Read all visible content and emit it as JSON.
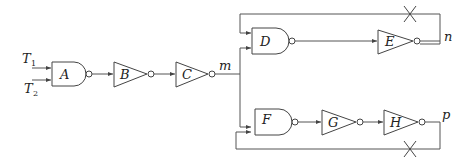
{
  "diagram": {
    "title": "",
    "inputs": [
      {
        "name": "T",
        "sub": "1"
      },
      {
        "name": "T",
        "sub": "2"
      }
    ],
    "gates": {
      "A": {
        "label": "A",
        "type": "NAND"
      },
      "B": {
        "label": "B",
        "type": "NOT"
      },
      "C": {
        "label": "C",
        "type": "NOT"
      },
      "D": {
        "label": "D",
        "type": "NAND"
      },
      "E": {
        "label": "E",
        "type": "NOT"
      },
      "F": {
        "label": "F",
        "type": "NAND"
      },
      "G": {
        "label": "G",
        "type": "NOT"
      },
      "H": {
        "label": "H",
        "type": "NOT"
      }
    },
    "nodes": {
      "m": "m",
      "n": "n",
      "p": "p"
    },
    "feedback_cuts": [
      {
        "from": "n",
        "to": "D",
        "marker": "X"
      },
      {
        "from": "p",
        "to": "F",
        "marker": "X"
      }
    ],
    "colors": {
      "stroke": "#444444",
      "background": "#ffffff"
    }
  }
}
